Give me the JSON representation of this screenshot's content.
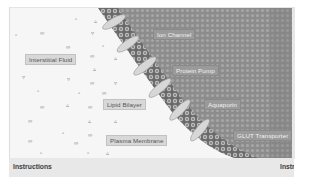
{
  "simulation": {
    "title": "Cell Membrane Transport",
    "labels": {
      "interstitial_fluid": "Interstitial Fluid",
      "ion_channel": "Ion Channel",
      "protein_pump": "Protein Pump",
      "lipid_bilayer": "Lipid Bilayer",
      "aquaporin": "Aquaporin",
      "plasma_membrane": "Plasma Membrane",
      "glut_transporter": "GLUT Transporter"
    },
    "colors": {
      "fluid_bg": "#f6f6f6",
      "cytoplasm": "#8e8e8e",
      "membrane_dark": "#5a5a5a",
      "protein": "#d4d4d4",
      "label_bg": "#d8d8d8"
    }
  },
  "footer": {
    "instructions_left": "Instructions",
    "instructions_right": "Instru"
  }
}
